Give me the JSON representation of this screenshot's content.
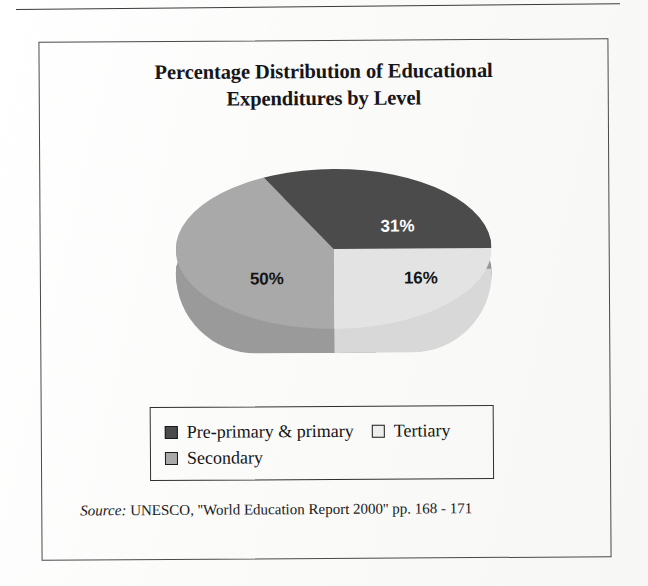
{
  "figure": {
    "title_line1": "Percentage Distribution of Educational",
    "title_line2": "Expenditures by Level"
  },
  "legend": {
    "items": [
      {
        "label": "Pre-primary & primary",
        "swatch": "dark-gray-swatch",
        "color": "#4b4b4b"
      },
      {
        "label": "Tertiary",
        "swatch": "light-gray-swatch",
        "color": "#eeeeee"
      },
      {
        "label": "Secondary",
        "swatch": "medium-gray-swatch",
        "color": "#a9a9a9"
      }
    ]
  },
  "pie_labels": {
    "dark": "31%",
    "light": "16%",
    "mid": "50%"
  },
  "source": {
    "label": "Source:",
    "text": "UNESCO, ''World Education Report 2000'' pp. 168 - 171"
  },
  "chart_data": {
    "type": "pie",
    "title": "Percentage Distribution of Educational Expenditures by Level",
    "categories": [
      "Pre-primary & primary",
      "Tertiary",
      "Secondary"
    ],
    "values": [
      31,
      16,
      50
    ],
    "value_labels": [
      "31%",
      "16%",
      "50%"
    ],
    "colors": [
      "#4b4b4b",
      "#e3e3e3",
      "#a9a9a9"
    ],
    "units": "percent",
    "legend_position": "bottom",
    "three_d": true,
    "grid": false,
    "xlabel": "",
    "ylabel": "",
    "annotations": [
      "Source: UNESCO, ''World Education Report 2000'' pp. 168 - 171"
    ]
  }
}
